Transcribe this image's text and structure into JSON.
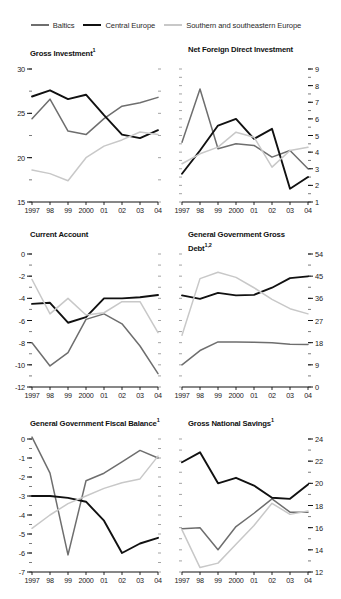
{
  "legend": {
    "items": [
      {
        "label": "Baltics",
        "color": "#6e6e6e"
      },
      {
        "label": "Central Europe",
        "color": "#111111"
      },
      {
        "label": "Southern and southeastern Europe",
        "color": "#c8c8c8"
      }
    ]
  },
  "series_names": [
    "Baltics",
    "Central Europe",
    "Southern and southeastern Europe"
  ],
  "x_categories": [
    "1997",
    "98",
    "99",
    "2000",
    "01",
    "02",
    "03",
    "04"
  ],
  "chart_data": [
    {
      "type": "line",
      "title": "Gross Investment",
      "title_superscript": "1",
      "xlabel": "",
      "ylabel": "",
      "ylim": [
        15,
        30
      ],
      "yticks": [
        15,
        20,
        25,
        30
      ],
      "ytick_labels": [
        "15",
        "20",
        "25",
        "30"
      ],
      "minor_ytick_step": 2.5,
      "axis_side": "left",
      "grid": false,
      "legend_position": "top",
      "categories": [
        "1997",
        "98",
        "99",
        "2000",
        "01",
        "02",
        "03",
        "04"
      ],
      "series": [
        {
          "name": "Baltics",
          "color": "#6e6e6e",
          "values": [
            24.4,
            26.6,
            23.0,
            22.6,
            24.4,
            25.8,
            26.2,
            26.8
          ]
        },
        {
          "name": "Central Europe",
          "color": "#111111",
          "values": [
            26.9,
            27.6,
            26.6,
            27.1,
            24.8,
            22.6,
            22.2,
            23.1
          ]
        },
        {
          "name": "Southern and southeastern Europe",
          "color": "#c8c8c8",
          "values": [
            18.6,
            18.2,
            17.4,
            20.0,
            21.3,
            22.0,
            22.9,
            22.6
          ]
        }
      ]
    },
    {
      "type": "line",
      "title": "Net Foreign Direct Investment",
      "title_superscript": "",
      "xlabel": "",
      "ylabel": "",
      "ylim": [
        1,
        9
      ],
      "yticks": [
        1,
        2,
        3,
        4,
        5,
        6,
        7,
        8,
        9
      ],
      "ytick_labels": [
        "1",
        "2",
        "3",
        "4",
        "5",
        "6",
        "7",
        "8",
        "9"
      ],
      "minor_ytick_step": 0.5,
      "axis_side": "right",
      "grid": false,
      "legend_position": "top",
      "categories": [
        "1997",
        "98",
        "99",
        "2000",
        "01",
        "02",
        "03",
        "04"
      ],
      "series": [
        {
          "name": "Baltics",
          "color": "#6e6e6e",
          "values": [
            4.6,
            7.8,
            4.2,
            4.5,
            4.4,
            3.7,
            4.1,
            3.0
          ]
        },
        {
          "name": "Central Europe",
          "color": "#111111",
          "values": [
            2.7,
            4.1,
            5.6,
            6.0,
            4.8,
            5.4,
            1.8,
            2.5
          ]
        },
        {
          "name": "Southern and southeastern Europe",
          "color": "#c8c8c8",
          "values": [
            3.3,
            3.9,
            4.3,
            5.2,
            4.9,
            3.1,
            4.1,
            4.3
          ]
        }
      ]
    },
    {
      "type": "line",
      "title": "Current Account",
      "title_superscript": "",
      "xlabel": "",
      "ylabel": "",
      "ylim": [
        -12,
        0
      ],
      "yticks": [
        -12,
        -10,
        -8,
        -6,
        -4,
        -2,
        0
      ],
      "ytick_labels": [
        "-12",
        "-10",
        "-8",
        "-6",
        "-4",
        "-2",
        "0"
      ],
      "minor_ytick_step": 1,
      "axis_side": "left",
      "grid": false,
      "legend_position": "top",
      "categories": [
        "1997",
        "98",
        "99",
        "2000",
        "01",
        "02",
        "03",
        "04"
      ],
      "series": [
        {
          "name": "Baltics",
          "color": "#6e6e6e",
          "values": [
            -8.0,
            -10.1,
            -8.9,
            -5.9,
            -5.4,
            -6.3,
            -8.3,
            -10.8
          ]
        },
        {
          "name": "Central Europe",
          "color": "#111111",
          "values": [
            -4.5,
            -4.4,
            -6.2,
            -5.7,
            -4.0,
            -4.0,
            -3.9,
            -3.7
          ]
        },
        {
          "name": "Southern and southeastern Europe",
          "color": "#c8c8c8",
          "values": [
            -2.3,
            -5.4,
            -4.0,
            -5.5,
            -5.3,
            -4.3,
            -4.3,
            -7.1
          ]
        }
      ]
    },
    {
      "type": "line",
      "title": "General Government Gross Debt",
      "title_superscript": "1,2",
      "xlabel": "",
      "ylabel": "",
      "ylim": [
        0,
        54
      ],
      "yticks": [
        0,
        9,
        18,
        27,
        36,
        45,
        54
      ],
      "ytick_labels": [
        "0",
        "9",
        "18",
        "27",
        "36",
        "45",
        "54"
      ],
      "minor_ytick_step": 4.5,
      "axis_side": "right",
      "grid": false,
      "legend_position": "top",
      "categories": [
        "1997",
        "98",
        "99",
        "2000",
        "01",
        "02",
        "03",
        "04"
      ],
      "series": [
        {
          "name": "Baltics",
          "color": "#6e6e6e",
          "values": [
            9.0,
            14.8,
            18.3,
            18.3,
            18.2,
            18.0,
            17.4,
            17.3
          ]
        },
        {
          "name": "Central Europe",
          "color": "#111111",
          "values": [
            37.2,
            35.8,
            38.2,
            37.2,
            37.4,
            40.3,
            44.2,
            44.9
          ]
        },
        {
          "name": "Southern and southeastern Europe",
          "color": "#c8c8c8",
          "values": [
            21.0,
            44.0,
            46.6,
            44.5,
            40.3,
            35.6,
            31.8,
            29.7
          ]
        }
      ]
    },
    {
      "type": "line",
      "title": "General Government Fiscal Balance",
      "title_superscript": "1",
      "xlabel": "",
      "ylabel": "",
      "ylim": [
        -7,
        0
      ],
      "yticks": [
        -7,
        -6,
        -5,
        -4,
        -3,
        -2,
        -1,
        0
      ],
      "ytick_labels": [
        "-7",
        "-6",
        "-5",
        "-4",
        "-3",
        "-2",
        "-1",
        "0"
      ],
      "minor_ytick_step": 0.5,
      "axis_side": "left",
      "grid": false,
      "legend_position": "top",
      "categories": [
        "1997",
        "98",
        "99",
        "2000",
        "01",
        "02",
        "03",
        "04"
      ],
      "series": [
        {
          "name": "Baltics",
          "color": "#6e6e6e",
          "values": [
            0.1,
            -1.8,
            -6.1,
            -2.2,
            -1.8,
            -1.2,
            -0.6,
            -1.0
          ]
        },
        {
          "name": "Central Europe",
          "color": "#111111",
          "values": [
            -3.0,
            -3.0,
            -3.1,
            -3.3,
            -4.3,
            -6.0,
            -5.5,
            -5.2
          ]
        },
        {
          "name": "Southern and southeastern Europe",
          "color": "#c8c8c8",
          "values": [
            -4.7,
            -4.0,
            -3.4,
            -3.0,
            -2.6,
            -2.3,
            -2.1,
            -0.9
          ]
        }
      ]
    },
    {
      "type": "line",
      "title": "Gross National Savings",
      "title_superscript": "1",
      "xlabel": "",
      "ylabel": "",
      "ylim": [
        12,
        24
      ],
      "yticks": [
        12,
        14,
        16,
        18,
        20,
        22,
        24
      ],
      "ytick_labels": [
        "12",
        "14",
        "16",
        "18",
        "20",
        "22",
        "24"
      ],
      "minor_ytick_step": 1,
      "axis_side": "right",
      "grid": false,
      "legend_position": "top",
      "categories": [
        "1997",
        "98",
        "99",
        "2000",
        "01",
        "02",
        "03",
        "04"
      ],
      "series": [
        {
          "name": "Baltics",
          "color": "#6e6e6e",
          "values": [
            15.9,
            16.0,
            14.0,
            16.1,
            17.3,
            18.6,
            17.4,
            17.4
          ]
        },
        {
          "name": "Central Europe",
          "color": "#111111",
          "values": [
            21.9,
            22.8,
            20.0,
            20.5,
            19.8,
            18.7,
            18.6,
            19.9
          ]
        },
        {
          "name": "Southern and southeastern Europe",
          "color": "#c8c8c8",
          "values": [
            15.8,
            12.4,
            12.8,
            14.5,
            16.2,
            18.2,
            17.2,
            17.5
          ]
        }
      ]
    }
  ]
}
